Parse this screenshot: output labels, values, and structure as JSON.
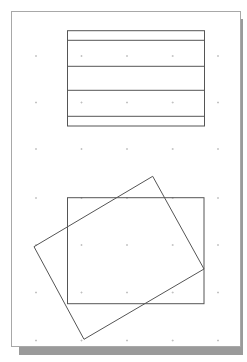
{
  "page": {
    "background": "#ffffff",
    "border_color": "#a8a8a8",
    "shadow_color": "#9a9a9a"
  },
  "grid": {
    "dot_color": "#bbbbbb",
    "columns_x": [
      36,
      81.5,
      127,
      172.7,
      218
    ],
    "rows_y": [
      56,
      102.5,
      149,
      198,
      245,
      292.5,
      340.5
    ]
  },
  "shapes": {
    "line_color": "#555555",
    "top_rectangle": {
      "x": 67.5,
      "y": 30.7,
      "width": 137,
      "height": 95.3
    },
    "top_rectangle_dividers_y": [
      40.3,
      66.3,
      90.3,
      116.3
    ],
    "bottom_rectangle": {
      "x": 67.5,
      "y": 197.7,
      "width": 136.5,
      "height": 106
    },
    "rotated_rectangle_points": [
      [
        152.7,
        176.3
      ],
      [
        204,
        269
      ],
      [
        84,
        339.3
      ],
      [
        34,
        246.7
      ]
    ]
  }
}
